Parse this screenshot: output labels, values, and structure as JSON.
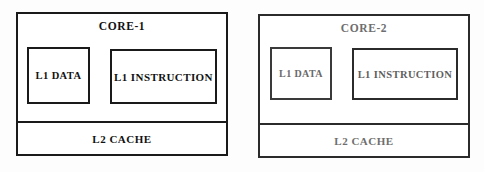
{
  "diagram": {
    "background_color": "#fdfdfd",
    "cores": [
      {
        "id": "core-1",
        "title": "CORE-1",
        "stroke_color": "#1a1a1a",
        "text_color": "#121212",
        "l1_data": {
          "label": "L1 DATA"
        },
        "l1_instruction": {
          "label": "L1 INSTRUCTION"
        },
        "l2_cache": {
          "label": "L2 CACHE"
        }
      },
      {
        "id": "core-2",
        "title": "CORE-2",
        "stroke_color": "#2b2b2b",
        "text_color": "#6e6e6e",
        "l1_data": {
          "label": "L1 DATA"
        },
        "l1_instruction": {
          "label": "L1 INSTRUCTION"
        },
        "l2_cache": {
          "label": "L2 CACHE"
        }
      }
    ]
  }
}
